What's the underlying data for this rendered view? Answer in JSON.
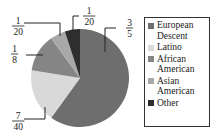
{
  "chart_data": {
    "type": "pie",
    "title": "",
    "categories": [
      "European Descent",
      "Latino",
      "African American",
      "Asian American",
      "Other"
    ],
    "values": [
      0.6,
      0.175,
      0.125,
      0.05,
      0.05
    ],
    "value_labels": [
      {
        "num": "3",
        "den": "5"
      },
      {
        "num": "7",
        "den": "40"
      },
      {
        "num": "1",
        "den": "8"
      },
      {
        "num": "1",
        "den": "20"
      },
      {
        "num": "1",
        "den": "20"
      }
    ],
    "colors": [
      "#6e6e6e",
      "#d9d9d9",
      "#858585",
      "#a8a8a8",
      "#2e2e2e"
    ],
    "start_angle_deg": 0,
    "direction": "clockwise",
    "legend_position": "right",
    "legend": [
      {
        "label": "European Descent",
        "color": "#6e6e6e"
      },
      {
        "label": "Latino",
        "color": "#d9d9d9"
      },
      {
        "label": "African American",
        "color": "#858585"
      },
      {
        "label": "Asian American",
        "color": "#a8a8a8"
      },
      {
        "label": "Other",
        "color": "#2e2e2e"
      }
    ]
  }
}
